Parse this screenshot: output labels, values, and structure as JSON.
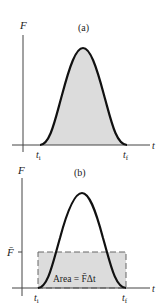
{
  "panels": [
    {
      "id": "a",
      "label": "(a)",
      "y_axis_label": "F",
      "x_axis_label": "t",
      "t_initial": "t",
      "t_initial_sub": "i",
      "t_final": "t",
      "t_final_sub": "f",
      "description": "Force vs time pulse; shaded area under curve"
    },
    {
      "id": "b",
      "label": "(b)",
      "y_axis_label": "F",
      "y_tick_label": "F̄",
      "x_axis_label": "t",
      "t_initial": "t",
      "t_initial_sub": "i",
      "t_final": "t",
      "t_final_sub": "f",
      "area_label": "Area = F̄Δt",
      "description": "Same pulse with average force rectangle of equal area"
    }
  ],
  "colors": {
    "curve": "#111111",
    "fill": "#dcdcdc",
    "axis": "#444444",
    "dashed": "#666666"
  }
}
